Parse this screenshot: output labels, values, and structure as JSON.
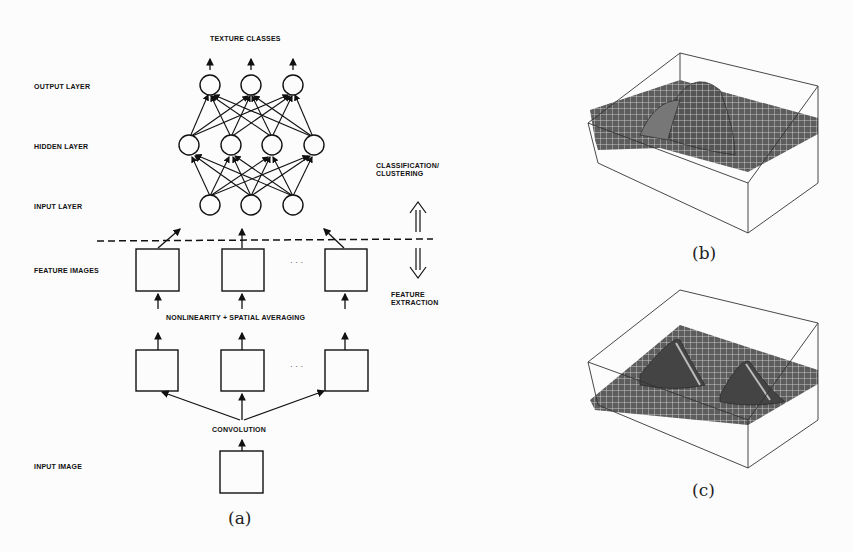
{
  "diagram_a": {
    "title_top": "TEXTURE CLASSES",
    "layers": {
      "output": "OUTPUT LAYER",
      "hidden": "HIDDEN LAYER",
      "input": "INPUT LAYER",
      "feature_images": "FEATURE IMAGES",
      "input_image": "INPUT IMAGE"
    },
    "stages": {
      "classification": [
        "CLASSIFICATION/",
        "CLUSTERING"
      ],
      "feature_extraction": [
        "FEATURE",
        "EXTRACTION"
      ],
      "nonlinearity": "NONLINEARITY + SPATIAL AVERAGING",
      "convolution": "CONVOLUTION"
    },
    "ellipsis": "· · ·",
    "network": {
      "output_nodes": 3,
      "hidden_nodes": 4,
      "input_nodes": 3
    },
    "caption": "(a)"
  },
  "plot_b": {
    "caption": "(b)",
    "description": "3D surface plot with single elongated ridge"
  },
  "plot_c": {
    "caption": "(c)",
    "description": "3D surface plot with two peaks"
  }
}
